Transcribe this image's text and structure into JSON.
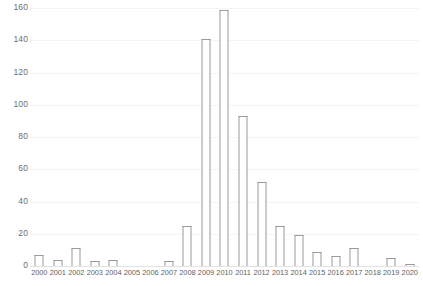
{
  "chart_data": {
    "type": "bar",
    "title": "",
    "subtitle": "",
    "xlabel": "",
    "ylabel": "",
    "categories": [
      "2000",
      "2001",
      "2002",
      "2003",
      "2004",
      "2005",
      "2006",
      "2007",
      "2008",
      "2009",
      "2010",
      "2011",
      "2012",
      "2013",
      "2014",
      "2015",
      "2016",
      "2017",
      "2018",
      "2019",
      "2020"
    ],
    "values": [
      7,
      4,
      11,
      3,
      4,
      0,
      0,
      3,
      25,
      141,
      159,
      93,
      52,
      25,
      19,
      9,
      6,
      11,
      0,
      5,
      1
    ],
    "ylim": [
      0,
      160
    ],
    "yticks": [
      0,
      20,
      40,
      60,
      80,
      100,
      120,
      140,
      160
    ],
    "ytick_labels": [
      "0",
      "20",
      "40",
      "60",
      "80",
      "100",
      "120",
      "140",
      "160"
    ],
    "grid": true,
    "grid_axis": "y",
    "legend": false,
    "legend_position": "none",
    "series": [
      {
        "name": "count",
        "values": [
          7,
          4,
          11,
          3,
          4,
          0,
          0,
          3,
          25,
          141,
          159,
          93,
          52,
          25,
          19,
          9,
          6,
          11,
          0,
          5,
          1
        ]
      }
    ],
    "colors": {
      "bar_fill": "#ffffff",
      "bar_stroke": "#9a9a9a",
      "gridline": "#f4f4f4",
      "axis_line": "#e2e2e2",
      "tick_text": "#6e6e6e",
      "background": "#ffffff"
    }
  }
}
